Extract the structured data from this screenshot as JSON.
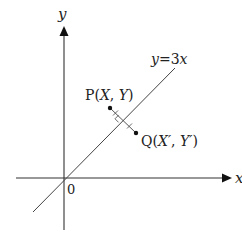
{
  "figure": {
    "axes": {
      "x_label": "x",
      "y_label": "y",
      "origin_label": "0"
    },
    "line": {
      "label": "y=3x",
      "label_parts": {
        "lhs": "y",
        "eq": "=",
        "rhs": "3x"
      }
    },
    "points": {
      "P": {
        "name": "P",
        "open": "(",
        "coord1": "X",
        "sep": ", ",
        "coord2": "Y",
        "close": ")"
      },
      "Q": {
        "name": "Q",
        "open": "(",
        "coord1": "X′",
        "sep": ", ",
        "coord2": "Y′",
        "close": ")"
      }
    },
    "colors": {
      "axis": "#333333",
      "line": "#444444",
      "point": "#111111",
      "text": "#222222"
    }
  }
}
